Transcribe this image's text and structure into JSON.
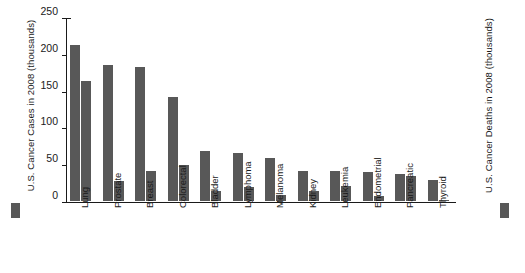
{
  "chart_data": {
    "type": "bar",
    "title": "",
    "xlabel": "",
    "ylabel": "U.S. Cancer Cases in 2008 (thousands)",
    "ylabel_right": "U.S. Cancer Deaths in 2008 (thousands)",
    "ylim": [
      0,
      250
    ],
    "yticks": [
      0,
      50,
      100,
      150,
      200,
      250
    ],
    "grid": false,
    "legend_position": "left-and-right-bottom",
    "bar_color": "#585858",
    "axis_color": "#1a1a1a",
    "categories": [
      "Lung",
      "Prostate",
      "Breast",
      "Colorectal",
      "Bladder",
      "Lymphoma",
      "Melanoma",
      "Kidney",
      "Leukemia",
      "Endometrial",
      "Pancreatic",
      "Thyroid"
    ],
    "series": [
      {
        "name": "U.S. Cancer Cases in 2008 (thousands)",
        "values": [
          212,
          185,
          182,
          142,
          68,
          65,
          59,
          41,
          41,
          40,
          37,
          28
        ]
      },
      {
        "name": "U.S. Cancer Deaths in 2008 (thousands)",
        "values": [
          163,
          27,
          41,
          49,
          14,
          19,
          8,
          13,
          21,
          7,
          34,
          2
        ]
      }
    ]
  },
  "legend": {
    "cases_swatch": "cases-swatch",
    "deaths_swatch": "deaths-swatch"
  }
}
